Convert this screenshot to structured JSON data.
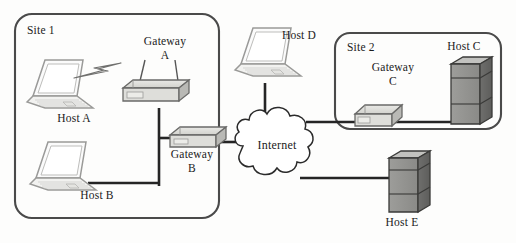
{
  "diagram": {
    "background_color": "#fdfdfc",
    "line_color": "#2b2b2b",
    "label_color": "#1b1b1b"
  },
  "sites": [
    {
      "id": "site-1",
      "label": "Site 1",
      "x": 15,
      "y": 14,
      "width": 204,
      "height": 204
    },
    {
      "id": "site-2",
      "label": "Site 2",
      "x": 335,
      "y": 33,
      "width": 166,
      "height": 96
    }
  ],
  "cloud": {
    "label": "Internet",
    "cx": 277,
    "cy": 152,
    "label_x": 277,
    "label_y": 145
  },
  "nodes": [
    {
      "id": "host-a",
      "label": "Host A",
      "type": "laptop",
      "label_x": 74,
      "label_y": 117,
      "device_x": 25,
      "device_y": 60
    },
    {
      "id": "host-b",
      "label": "Host B",
      "type": "laptop",
      "label_x": 97,
      "label_y": 194,
      "device_x": 30,
      "device_y": 143
    },
    {
      "id": "host-c",
      "label": "Host C",
      "type": "server",
      "label_x": 464,
      "label_y": 45,
      "device_x": 447,
      "device_y": 63
    },
    {
      "id": "host-d",
      "label": "Host D",
      "type": "laptop",
      "label_x": 299,
      "label_y": 34,
      "device_x": 233,
      "device_y": 27
    },
    {
      "id": "host-e",
      "label": "Host E",
      "type": "server",
      "label_x": 402,
      "label_y": 222,
      "device_x": 381,
      "device_y": 152
    },
    {
      "id": "gateway-a",
      "label": "Gateway",
      "sublabel": "A",
      "type": "router-antenna",
      "label_x": 165,
      "label_y": 40,
      "sublabel_x": 165,
      "sublabel_y": 54,
      "device_x": 120,
      "device_y": 80
    },
    {
      "id": "gateway-b",
      "label": "Gateway",
      "sublabel": "B",
      "type": "router",
      "label_x": 192,
      "label_y": 153,
      "sublabel_x": 192,
      "sublabel_y": 167,
      "device_x": 168,
      "device_y": 130
    },
    {
      "id": "gateway-c",
      "label": "Gateway",
      "sublabel": "C",
      "type": "router",
      "label_x": 393,
      "label_y": 66,
      "sublabel_x": 393,
      "sublabel_y": 80,
      "device_x": 352,
      "device_y": 102
    }
  ],
  "links": [
    {
      "id": "link-host-a-gateway-a",
      "kind": "wireless",
      "from": "host-a",
      "to": "gateway-a"
    },
    {
      "id": "link-gateway-a-bus",
      "kind": "wired",
      "from": "gateway-a",
      "to": "bus"
    },
    {
      "id": "link-host-b-bus",
      "kind": "wired",
      "from": "host-b",
      "to": "bus"
    },
    {
      "id": "link-bus-gateway-b",
      "kind": "wired",
      "from": "bus",
      "to": "gateway-b"
    },
    {
      "id": "link-gateway-b-internet",
      "kind": "wired",
      "from": "gateway-b",
      "to": "cloud"
    },
    {
      "id": "link-host-d-internet",
      "kind": "wired",
      "from": "host-d",
      "to": "cloud"
    },
    {
      "id": "link-internet-gateway-c",
      "kind": "wired",
      "from": "cloud",
      "to": "gateway-c"
    },
    {
      "id": "link-gateway-c-host-c",
      "kind": "wired",
      "from": "gateway-c",
      "to": "host-c"
    },
    {
      "id": "link-internet-host-e",
      "kind": "wired",
      "from": "cloud",
      "to": "host-e"
    }
  ]
}
